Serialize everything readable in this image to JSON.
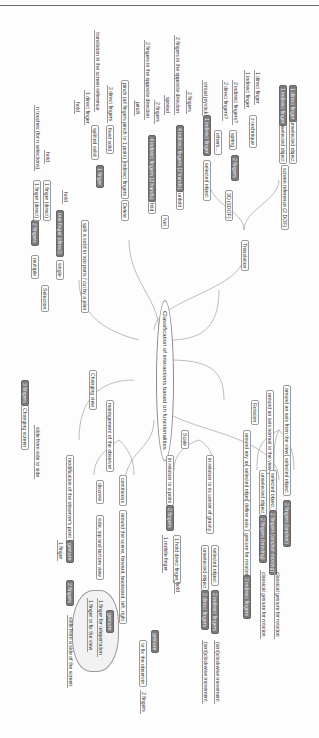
{
  "page": {
    "header_text": ""
  },
  "mindmap": {
    "root": "Classification of interactions based on functionalities",
    "branches": {
      "translation": {
        "label": "Translation",
        "screen_ref": "screen reference (2 DOF)",
        "screen_ref_children": [
          "unselected object",
          "unselected object"
        ],
        "screen_ref_leaves": [
          "1 direct finger",
          "1 indirect finger"
        ],
        "three_d": "3D (3DOF)",
        "two_fingers": "2 fingers",
        "z_technique": "z-technique",
        "z_leaves": [
          "1 direct finger",
          "1 indirect finger"
        ],
        "spring": "spring",
        "spring_leaves": [
          "2 indirect fingers?",
          "2 direct fingers?"
        ],
        "others": "others...",
        "selected_object": "selected object",
        "indirect_finger": "1 indirect finger",
        "virtual_joystick": "virtual joystick"
      },
      "net": {
        "label": "Net",
        "unfold": "unfold",
        "unfold_node": "4 indirect fingers (2 hands)",
        "unfold_leaves": [
          "2 fingers",
          "2 fingers in the opposite direction",
          "spread"
        ],
        "fold": "fold",
        "fold_node": "4 indirect fingers (2 hands)",
        "fold_leaves": [
          "2 fingers",
          "2 fingers in the opposite direction",
          "pinch"
        ],
        "delete": "Delete",
        "delete_node": "5 indirect fingers",
        "delete_leaf": "pinch (all fingers pinch to 1 point)",
        "fixed_solid": "fixed solid",
        "fixed_leaf": "2 direct fingers",
        "splitted_solid": "splitted solid",
        "splitted_leaves": [
          "translation in the screen reference",
          "1 direct finger",
          "hold"
        ],
        "split_node": "1 finger",
        "split_label": "split a solid in two parts / cut by a plan"
      },
      "selection": {
        "label": "Selection",
        "single": "single",
        "single_node": "one finger (direct)",
        "single_leaf": "hold",
        "multiple": "multiple",
        "multiple_node": "2 fingers",
        "multiple_leaves": [
          "1 finger (direct)",
          "1 finger (direct)",
          "hold",
          "n touches (for n selections)"
        ]
      },
      "changing_screen": {
        "label": "Changing screen",
        "node": "3 fingers",
        "leaf": "slide from side to side"
      },
      "changing_view": {
        "label": "Changing view",
        "management": "management of the observer",
        "continuous": "continuous",
        "continuous_leaf": "around the scene, forward, backward, left, right",
        "discrete": "discrete",
        "discrete_leaf": "side, top and bottom view",
        "modification": "modification of the observer's point of view",
        "modification_node": "gesture",
        "modification_leaf": "1 finger",
        "cloud_node": "gesture",
        "cloud_leaves": [
          "1 finger for teleportation",
          "1 finger to fix the view"
        ],
        "slide_node": "2 fingers",
        "slide_leaf": "slide from a side of the screen",
        "gesture_node": "gesture",
        "fix_observer": "to fix the observer",
        "two_fingers": "2 fingers"
      },
      "scale": {
        "label": "Scale",
        "center": "in relation to its center of gravity",
        "center_children": [
          "selected object",
          "unselected object"
        ],
        "center_nodes": [
          "2 indirect fingers",
          "2 direct fingers"
        ],
        "center_leaves": [
          "(anti)clockwise movement",
          "(anti)clockwise movement"
        ],
        "point": "in relation to a point",
        "point_node": "2 fingers",
        "point_leaves": [
          "1 hold direct finger",
          "1 mobile finger"
        ],
        "hold": "hold"
      },
      "rotation": {
        "label": "Rotation",
        "axis_view": "around an axis from the view",
        "axis_view_child": "selected object",
        "axis_view_node": "2 fingers (anchor)",
        "axis_normal": "around an axis normal to the view",
        "axis_normal_children": [
          "selected object",
          "unselected object"
        ],
        "axis_normal_nodes": [
          "2 fingers (anchor-moving)",
          "2 fingers (moving)"
        ],
        "axis_normal_leaves": [
          "classical gesture for rotation",
          "classical gesture for rotation"
        ],
        "any_axis": "around any axis",
        "any_axis_child": "selected object",
        "define_axis": "define axis",
        "gesture": "gesture for rotation",
        "gesture_node": "2 indirect fingers"
      }
    }
  }
}
